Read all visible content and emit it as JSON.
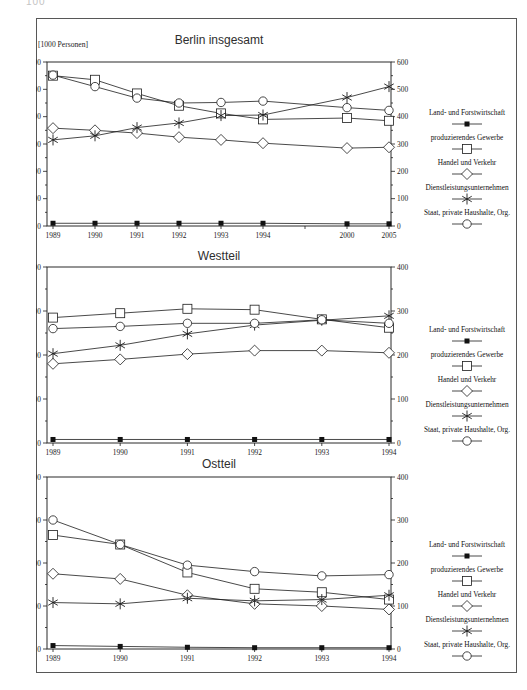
{
  "page": {
    "corner_marker": "100"
  },
  "chart_data": [
    {
      "type": "line",
      "title": "Berlin insgesamt",
      "unit_label": "[1000 Personen]",
      "x_tick_labels": [
        "1989",
        "1990",
        "1991",
        "1992",
        "1993",
        "1994",
        "",
        "2000",
        "2005"
      ],
      "x": [
        1989,
        1990,
        1991,
        1992,
        1993,
        1994,
        2000,
        2005
      ],
      "x_slots": [
        0,
        1,
        2,
        3,
        4,
        5,
        7,
        8
      ],
      "y_axis": {
        "min": 0,
        "max": 600,
        "major": 100,
        "minor": 50
      },
      "grid": "off",
      "legend_position": "right",
      "series": [
        {
          "name": "Land- und Forstwirtschaft",
          "marker": "filled-square",
          "values": [
            10,
            10,
            10,
            10,
            10,
            10,
            8,
            8
          ]
        },
        {
          "name": "produzierendes Gewerbe",
          "marker": "open-square",
          "values": [
            550,
            535,
            485,
            440,
            412,
            390,
            395,
            385
          ]
        },
        {
          "name": "Handel und Verkehr",
          "marker": "diamond",
          "values": [
            358,
            350,
            340,
            325,
            315,
            303,
            285,
            288
          ]
        },
        {
          "name": "Dienstleistungsunternehmen",
          "marker": "star",
          "values": [
            315,
            330,
            360,
            377,
            404,
            406,
            470,
            510
          ]
        },
        {
          "name": "Staat, private Haushalte, Org.",
          "marker": "circle",
          "values": [
            552,
            510,
            468,
            450,
            452,
            457,
            433,
            423
          ]
        }
      ]
    },
    {
      "type": "line",
      "title": "Westteil",
      "x_tick_labels": [
        "1989",
        "1990",
        "1991",
        "1992",
        "1993",
        "1994"
      ],
      "x": [
        1989,
        1990,
        1991,
        1992,
        1993,
        1994
      ],
      "x_slots": [
        0,
        1,
        2,
        3,
        4,
        5
      ],
      "y_axis": {
        "min": 0,
        "max": 400,
        "major": 100,
        "minor": 50
      },
      "grid": "off",
      "legend_position": "right",
      "series": [
        {
          "name": "Land- und Forstwirtschaft",
          "marker": "filled-square",
          "values": [
            8,
            8,
            8,
            8,
            8,
            8
          ]
        },
        {
          "name": "produzierendes Gewerbe",
          "marker": "open-square",
          "values": [
            285,
            295,
            305,
            303,
            281,
            262
          ]
        },
        {
          "name": "Handel und Verkehr",
          "marker": "diamond",
          "values": [
            180,
            190,
            202,
            210,
            210,
            205
          ]
        },
        {
          "name": "Dienstleistungsunternehmen",
          "marker": "star",
          "values": [
            203,
            222,
            248,
            268,
            279,
            289
          ]
        },
        {
          "name": "Staat, private Haushalte, Org.",
          "marker": "circle",
          "values": [
            260,
            265,
            272,
            272,
            280,
            272
          ]
        }
      ]
    },
    {
      "type": "line",
      "title": "Ostteil",
      "x_tick_labels": [
        "1989",
        "1990",
        "1991",
        "1992",
        "1993",
        "1994"
      ],
      "x": [
        1989,
        1990,
        1991,
        1992,
        1993,
        1994
      ],
      "x_slots": [
        0,
        1,
        2,
        3,
        4,
        5
      ],
      "y_axis": {
        "min": 0,
        "max": 400,
        "major": 100,
        "minor": 50
      },
      "grid": "off",
      "legend_position": "right",
      "series": [
        {
          "name": "Land- und Forstwirtschaft",
          "marker": "filled-square",
          "values": [
            8,
            6,
            4,
            3,
            3,
            3
          ]
        },
        {
          "name": "produzierendes Gewerbe",
          "marker": "open-square",
          "values": [
            265,
            243,
            178,
            140,
            132,
            115
          ]
        },
        {
          "name": "Handel und Verkehr",
          "marker": "diamond",
          "values": [
            175,
            163,
            125,
            105,
            100,
            92
          ]
        },
        {
          "name": "Dienstleistungsunternehmen",
          "marker": "star",
          "values": [
            108,
            105,
            118,
            112,
            115,
            125
          ]
        },
        {
          "name": "Staat, private Haushalte, Org.",
          "marker": "circle",
          "values": [
            300,
            243,
            195,
            180,
            170,
            173
          ]
        }
      ]
    }
  ]
}
